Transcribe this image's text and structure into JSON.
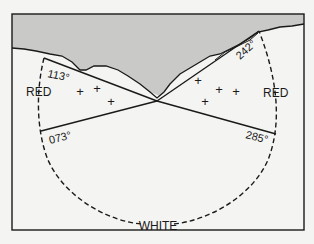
{
  "diagram": {
    "type": "light-sector-chart",
    "sectors": [
      {
        "name": "RED",
        "position": "left",
        "label": "RED"
      },
      {
        "name": "WHITE",
        "position": "bottom",
        "label": "WHITE"
      },
      {
        "name": "RED",
        "position": "right",
        "label": "RED"
      }
    ],
    "bearings": {
      "upper_left": "113°",
      "lower_left": "073°",
      "upper_right": "242°",
      "lower_right": "285°"
    },
    "labels": {
      "red_left": "RED",
      "red_right": "RED",
      "white_bottom": "WHITE"
    },
    "hazard_markers": {
      "left_count": 3,
      "right_count": 4,
      "glyph": "+"
    },
    "colors": {
      "land": "#c9c9c7",
      "water": "#f4f4f2",
      "line": "#1a1a1a"
    }
  }
}
